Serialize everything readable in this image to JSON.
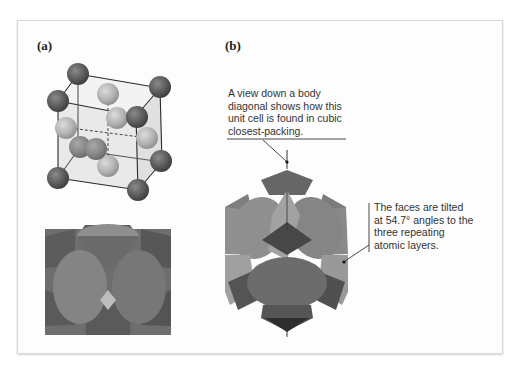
{
  "figure": {
    "panels": [
      {
        "label": "(a)",
        "description": "Face-centered cubic unit cell, ball-and-stick and space-filling views"
      },
      {
        "label": "(b)",
        "description": "Space-filling unit cell viewed down a body diagonal"
      }
    ],
    "callouts": {
      "body_diagonal": {
        "lines": [
          "A view down a body",
          "diagonal shows how this",
          "unit cell is found in cubic",
          "closest-packing."
        ]
      },
      "faces_tilted": {
        "lines": [
          "The faces are tilted",
          "at 54.7° angles to the",
          "three repeating",
          "atomic layers."
        ]
      }
    },
    "colors": {
      "corner_atom": "#5e5e5e",
      "face_atom": "#a9a9a9",
      "cell_fill": "#e6e6e6",
      "edge": "#2a2a2a",
      "space_fill_dark": "#555555",
      "space_fill_mid": "#7a7a7a",
      "space_fill_light": "#9c9c9c"
    }
  }
}
